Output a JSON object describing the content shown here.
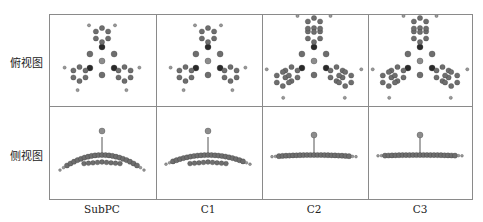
{
  "figure": {
    "row_labels": [
      "俯视图",
      "侧视图"
    ],
    "column_labels": [
      "SubPC",
      "C1",
      "C2",
      "C3"
    ],
    "cells": {
      "top_view": [
        {
          "molecule": "SubPC",
          "view": "top",
          "rings_per_arm": 1
        },
        {
          "molecule": "C1",
          "view": "top",
          "rings_per_arm": 1
        },
        {
          "molecule": "C2",
          "view": "top",
          "rings_per_arm": 2
        },
        {
          "molecule": "C3",
          "view": "top",
          "rings_per_arm": 2
        }
      ],
      "side_view": [
        {
          "molecule": "SubPC",
          "view": "side",
          "curvature": 0.9
        },
        {
          "molecule": "C1",
          "view": "side",
          "curvature": 0.55
        },
        {
          "molecule": "C2",
          "view": "side",
          "curvature": 0.1
        },
        {
          "molecule": "C3",
          "view": "side",
          "curvature": 0.05
        }
      ]
    },
    "colors": {
      "grid_line": "#8a8a8a",
      "carbon": "#6e6e6e",
      "nitrogen": "#2a2a2a",
      "hydrogen": "#9a9a9a",
      "boron": "#8c8c8c"
    }
  }
}
